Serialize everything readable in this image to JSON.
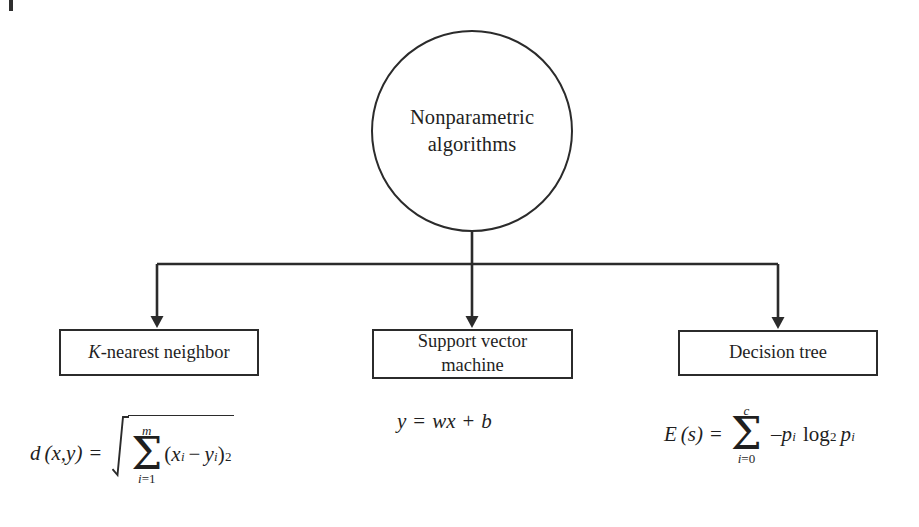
{
  "diagram": {
    "type": "tree",
    "root": {
      "label": "Nonparametric algorithms",
      "line1": "Nonparametric",
      "line2": "algorithms",
      "shape": "circle"
    },
    "children": [
      {
        "id": "knn",
        "label": "K-nearest neighbor",
        "label_italic_prefix": "K",
        "label_rest": "-nearest neighbor",
        "shape": "rectangle",
        "formula": {
          "latex": "d(x,y) = \\sqrt{\\sum_{i=1}^{m}(x_i - y_i)^2}",
          "lhs": "d",
          "lhs_args": "(x,y)",
          "equals": "=",
          "sum_upper": "m",
          "sum_lower_index": "i",
          "sum_lower_equals": "=",
          "sum_lower_value": "1",
          "radicand_open": "(",
          "radicand_x": "x",
          "radicand_x_sub": "i",
          "radicand_minus": "−",
          "radicand_y": "y",
          "radicand_y_sub": "i",
          "radicand_close": ")",
          "radicand_exponent": "2"
        }
      },
      {
        "id": "svm",
        "label": "Support vector machine",
        "line1": "Support vector",
        "line2": "machine",
        "shape": "rectangle",
        "formula": {
          "latex": "y = wx + b",
          "lhs": "y",
          "equals": "=",
          "rhs_w": "w",
          "rhs_x": "x",
          "plus": "+",
          "rhs_b": "b"
        }
      },
      {
        "id": "decision-tree",
        "label": "Decision tree",
        "shape": "rectangle",
        "formula": {
          "latex": "E(s) = \\sum_{i=0}^{c} -p_i \\log_2 p_i",
          "lhs": "E",
          "lhs_args": "(s)",
          "equals": "=",
          "sum_upper": "c",
          "sum_lower_index": "i",
          "sum_lower_equals": "=",
          "sum_lower_value": "0",
          "term_minus": "–",
          "term_p": "p",
          "term_p_sub": "i",
          "log": "log",
          "log_base": "2",
          "term_p2": "p",
          "term_p2_sub": "i"
        }
      }
    ],
    "connectors": {
      "style": "orthogonal-with-arrowheads",
      "stem_from": "root-circle-bottom",
      "branch_count": 3
    },
    "colors": {
      "stroke": "#2b2b2b",
      "text": "#1f1f1f",
      "background": "#ffffff"
    }
  }
}
